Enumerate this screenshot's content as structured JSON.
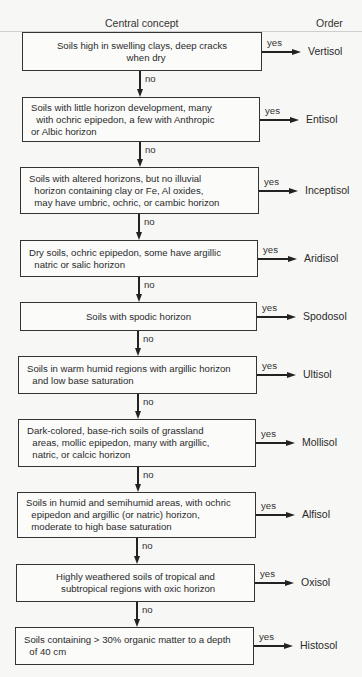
{
  "header": {
    "left": "Central concept",
    "right": "Order"
  },
  "edge_labels": {
    "yes": "yes",
    "no": "no"
  },
  "nodes": [
    {
      "lines": [
        "Soils high in swelling clays, deep cracks",
        "   when dry"
      ],
      "order": "Vertisol",
      "box": {
        "x": 22,
        "y": 32,
        "w": 240,
        "h": 39
      },
      "align": "center"
    },
    {
      "lines": [
        "Soils with little horizon development, many",
        "  with ochric epipedon, a few with Anthropic",
        "or Albic horizon"
      ],
      "order": "Entisol",
      "box": {
        "x": 22,
        "y": 97,
        "w": 238,
        "h": 45
      },
      "align": "left"
    },
    {
      "lines": [
        "Soils with altered horizons, but no illuvial",
        "  horizon containing clay or Fe, Al oxides,",
        "  may have umbric, ochric, or cambic horizon"
      ],
      "order": "Inceptisol",
      "box": {
        "x": 20,
        "y": 167,
        "w": 239,
        "h": 47
      },
      "align": "left"
    },
    {
      "lines": [
        "Dry soils, ochric epipedon, some have argillic",
        "  natric or salic horizon"
      ],
      "order": "Aridisol",
      "box": {
        "x": 20,
        "y": 240,
        "w": 238,
        "h": 37
      },
      "align": "left"
    },
    {
      "lines": [
        "Soils with spodic horizon"
      ],
      "order": "Spodosol",
      "box": {
        "x": 20,
        "y": 302,
        "w": 237,
        "h": 29
      },
      "align": "center"
    },
    {
      "lines": [
        "Soils in warm humid regions with argillic horizon",
        "  and low base saturation"
      ],
      "order": "Ultisol",
      "box": {
        "x": 18,
        "y": 356,
        "w": 239,
        "h": 38
      },
      "align": "left"
    },
    {
      "lines": [
        "Dark-colored, base-rich soils of grassland",
        "  areas, mollic epipedon, many with argillic,",
        "  natric, or calcic horizon"
      ],
      "order": "Mollisol",
      "box": {
        "x": 18,
        "y": 419,
        "w": 238,
        "h": 48
      },
      "align": "left"
    },
    {
      "lines": [
        "Soils in humid and semihumid areas, with ochric",
        "  epipedon and argillic (or natric) horizon,",
        "  moderate to high base saturation"
      ],
      "order": "Alfisol",
      "box": {
        "x": 17,
        "y": 492,
        "w": 239,
        "h": 46
      },
      "align": "left"
    },
    {
      "lines": [
        "Highly weathered soils of tropical and",
        "  subtropical regions with oxic horizon"
      ],
      "order": "Oxisol",
      "box": {
        "x": 16,
        "y": 564,
        "w": 239,
        "h": 38
      },
      "align": "center"
    },
    {
      "lines": [
        "Soils containing > 30% organic matter to a depth",
        "  of 40 cm"
      ],
      "order": "Histosol",
      "box": {
        "x": 15,
        "y": 627,
        "w": 239,
        "h": 38
      },
      "align": "left"
    }
  ],
  "colors": {
    "line": "#222222",
    "box_border": "#333333",
    "background": "#f7f7f5"
  }
}
